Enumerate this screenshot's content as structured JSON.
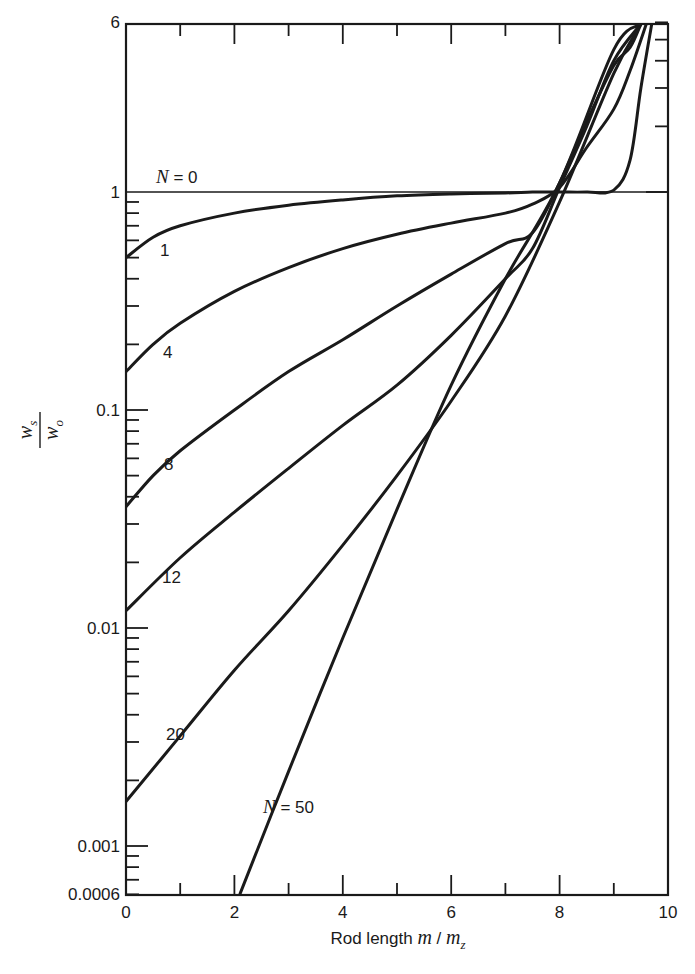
{
  "chart_data": {
    "type": "line",
    "title": "",
    "xlabel": "Rod length m / m_z",
    "xlabel_parts": {
      "prefix": "Rod length ",
      "var": "m",
      "sep": " / ",
      "var2": "m",
      "sub": "z"
    },
    "ylabel": "w_s / w_o",
    "ylabel_parts": {
      "num": "w",
      "num_sub": "s",
      "den": "w",
      "den_sub": "o"
    },
    "xlim": [
      0,
      10
    ],
    "ylim": [
      0.0006,
      6
    ],
    "yscale": "log",
    "grid": false,
    "x_ticks": [
      "0",
      "2",
      "4",
      "6",
      "8",
      "10"
    ],
    "y_ticks": [
      "0.0006",
      "0.001",
      "0.01",
      "0.1",
      "1",
      "6"
    ],
    "series": [
      {
        "name": "N = 0",
        "label": "N = 0",
        "x": [
          0,
          10
        ],
        "y": [
          1,
          1
        ]
      },
      {
        "name": "N = 1",
        "label": "1",
        "x": [
          0,
          0.5,
          1,
          2,
          3,
          4,
          5,
          6,
          7,
          7.5,
          8,
          8.5,
          9,
          9.3,
          9.5,
          9.7
        ],
        "y": [
          0.5,
          0.62,
          0.7,
          0.8,
          0.87,
          0.92,
          0.96,
          0.98,
          0.99,
          1.0,
          1.0,
          1.0,
          1.02,
          1.4,
          3,
          6
        ]
      },
      {
        "name": "N = 4",
        "label": "4",
        "x": [
          0,
          0.5,
          1,
          2,
          3,
          4,
          5,
          6,
          7,
          7.5,
          8,
          8.5,
          9,
          9.3,
          9.6
        ],
        "y": [
          0.15,
          0.2,
          0.25,
          0.35,
          0.45,
          0.55,
          0.64,
          0.72,
          0.8,
          0.88,
          1.05,
          1.6,
          2.4,
          3.6,
          6
        ]
      },
      {
        "name": "N = 8",
        "label": "8",
        "x": [
          0,
          0.5,
          1,
          2,
          3,
          4,
          5,
          6,
          7,
          7.5,
          8,
          8.5,
          9,
          9.3,
          9.5
        ],
        "y": [
          0.036,
          0.05,
          0.065,
          0.1,
          0.15,
          0.21,
          0.3,
          0.42,
          0.58,
          0.65,
          1.1,
          2.1,
          3.8,
          4.6,
          6
        ]
      },
      {
        "name": "N = 12",
        "label": "12",
        "x": [
          0,
          1,
          2,
          3,
          4,
          5,
          6,
          7,
          7.5,
          8,
          8.5,
          9,
          9.5
        ],
        "y": [
          0.012,
          0.021,
          0.034,
          0.054,
          0.085,
          0.13,
          0.22,
          0.4,
          0.55,
          1.05,
          2.0,
          4.0,
          6
        ]
      },
      {
        "name": "N = 20",
        "label": "20",
        "x": [
          0,
          1,
          2,
          3,
          4,
          5,
          6,
          7,
          8,
          9,
          9.5
        ],
        "y": [
          0.0016,
          0.0032,
          0.0064,
          0.012,
          0.024,
          0.05,
          0.11,
          0.27,
          0.9,
          3.5,
          6
        ]
      },
      {
        "name": "N = 50",
        "label": "N = 50",
        "x": [
          2.1,
          3,
          4,
          5,
          6,
          7,
          8,
          9,
          9.5
        ],
        "y": [
          0.0006,
          0.0022,
          0.009,
          0.035,
          0.13,
          0.4,
          1.1,
          4.5,
          6
        ]
      }
    ]
  }
}
